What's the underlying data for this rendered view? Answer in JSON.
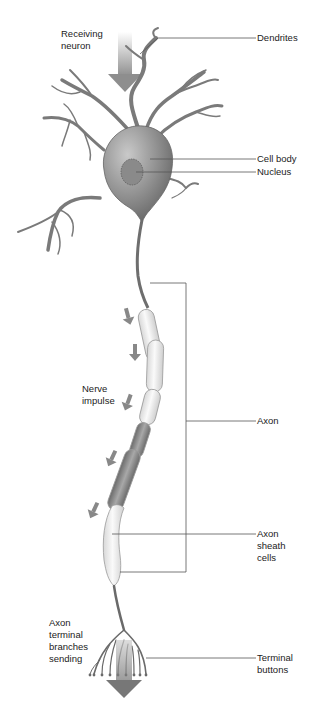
{
  "diagram": {
    "labels": {
      "receiving_neuron": "Receiving\nneuron",
      "dendrites": "Dendrites",
      "cell_body": "Cell body",
      "nucleus": "Nucleus",
      "nerve_impulse": "Nerve\nimpulse",
      "axon": "Axon",
      "axon_sheath_cells": "Axon\nsheath\ncells",
      "axon_terminal_branches": "Axon\nterminal\nbranches\nsending",
      "terminal_buttons": "Terminal\nbuttons"
    },
    "colors": {
      "neuron_fill": "#8a8a8a",
      "neuron_dark": "#5e5e5e",
      "sheath_fill": "#f2f2f2",
      "arrow": "#7d7d7d",
      "leader_line": "#555555"
    }
  }
}
